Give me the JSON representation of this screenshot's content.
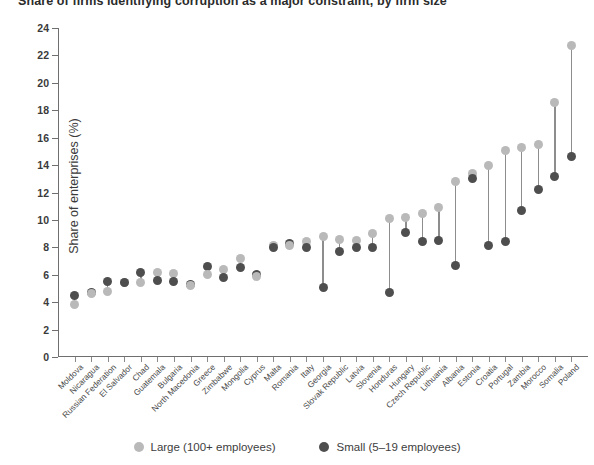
{
  "chart_data": {
    "type": "scatter",
    "subtype": "dumbbell",
    "title": "Share of firms identifying corruption as a major constraint, by firm size",
    "ylabel": "Share of enterprises (%)",
    "xlabel": "",
    "ylim": [
      0,
      24
    ],
    "ytick_step": 2,
    "yticks": [
      0,
      2,
      4,
      6,
      8,
      10,
      12,
      14,
      16,
      18,
      20,
      22,
      24
    ],
    "grid": false,
    "legend_position": "bottom-center",
    "categories": [
      "Moldova",
      "Nicaragua",
      "Russian Federation",
      "El Salvador",
      "Chad",
      "Guatemala",
      "Bulgaria",
      "North Macedonia",
      "Greece",
      "Zimbabwe",
      "Mongolia",
      "Cyprus",
      "Malta",
      "Romania",
      "Italy",
      "Georgia",
      "Slovak Republic",
      "Latvia",
      "Slovenia",
      "Honduras",
      "Hungary",
      "Czech Republic",
      "Lithuania",
      "Albania",
      "Estonia",
      "Croatia",
      "Portugal",
      "Zambia",
      "Morocco",
      "Somalia",
      "Poland"
    ],
    "series": [
      {
        "name": "Large (100+ employees)",
        "color": "#b9b9b9",
        "values": [
          3.8,
          4.6,
          4.8,
          5.4,
          5.4,
          6.2,
          6.1,
          5.2,
          6.0,
          6.4,
          7.2,
          5.9,
          8.1,
          8.1,
          8.4,
          8.8,
          8.6,
          8.5,
          9.0,
          10.1,
          10.2,
          10.5,
          10.9,
          12.8,
          13.4,
          14.0,
          15.1,
          15.3,
          15.5,
          18.6,
          22.7
        ]
      },
      {
        "name": "Small (5–19 employees)",
        "color": "#4e4e4e",
        "values": [
          4.5,
          4.7,
          5.5,
          5.4,
          6.2,
          5.6,
          5.5,
          5.3,
          6.6,
          5.8,
          6.5,
          6.0,
          8.0,
          8.3,
          8.0,
          5.1,
          7.7,
          8.0,
          8.0,
          4.7,
          9.1,
          8.4,
          8.5,
          6.7,
          13.0,
          8.1,
          8.4,
          10.7,
          12.2,
          13.2,
          14.6
        ]
      }
    ],
    "legend": [
      {
        "label": "Large (100+ employees)",
        "color": "#b9b9b9",
        "icon": "circle-marker-icon"
      },
      {
        "label": "Small (5–19 employees)",
        "color": "#4e4e4e",
        "icon": "circle-marker-icon"
      }
    ]
  }
}
